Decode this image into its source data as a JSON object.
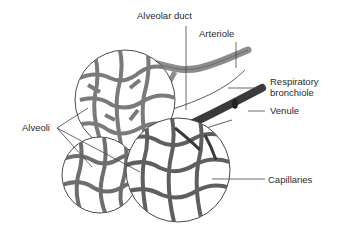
{
  "diagram": {
    "labels": {
      "alveolar_duct": "Alveolar duct",
      "arteriole": "Arteriole",
      "respiratory_bronchiole_line1": "Respiratory",
      "respiratory_bronchiole_line2": "bronchiole",
      "venule": "Venule",
      "alveoli": "Alveoli",
      "capillaries": "Capillaries"
    },
    "colors": {
      "background": "#ffffff",
      "capillary_mesh": "#7a7a7a",
      "arteriole": "#8c8c8c",
      "venule": "#3a3a3a",
      "outline": "#333333",
      "leader_line": "#444444"
    }
  }
}
